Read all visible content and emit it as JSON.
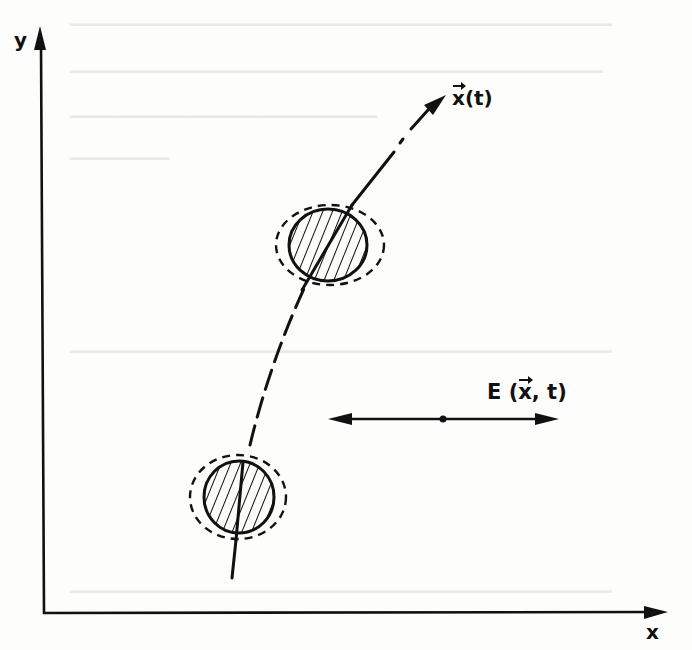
{
  "figure": {
    "type": "physics-schematic",
    "colors": {
      "ink": "#111111",
      "paper": "#fdfdfc",
      "bleed_through": "#e9e9e6"
    }
  },
  "axes": {
    "x_label": "x",
    "y_label": "y",
    "origin_px": [
      44,
      613
    ],
    "x_axis_end_px": [
      668,
      612
    ],
    "y_axis_end_px": [
      40,
      26
    ]
  },
  "trajectory": {
    "label_base": "x",
    "label_arg": "(t)",
    "style": "dash-dot curve ending in arrowhead",
    "arrow_tip_px": [
      446,
      95
    ]
  },
  "particles": [
    {
      "name": "upper",
      "center_px": [
        328,
        245
      ],
      "solid_radius": [
        39,
        36
      ],
      "halo_radius": [
        54,
        40
      ],
      "fill": "diagonal hatching"
    },
    {
      "name": "lower",
      "center_px": [
        239,
        497
      ],
      "solid_radius": [
        35,
        36
      ],
      "halo_radius": [
        48,
        42
      ],
      "fill": "diagonal hatching"
    }
  ],
  "field": {
    "label_prefix": "E (",
    "label_vec": "x",
    "label_suffix": ", t)",
    "style": "double-headed horizontal arrow with center dot",
    "from_px": [
      328,
      419
    ],
    "to_px": [
      558,
      419
    ],
    "center_dot_px": [
      443,
      419
    ]
  }
}
